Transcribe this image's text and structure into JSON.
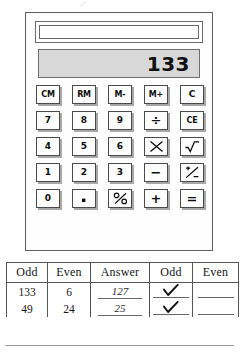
{
  "page": {
    "stray_mark": "⁄"
  },
  "calculator": {
    "display_value": "133",
    "solar_panel_label": "solar-panel",
    "keys": [
      [
        {
          "label": "CM",
          "name": "key-cm",
          "style": "wide-glyph"
        },
        {
          "label": "RM",
          "name": "key-rm",
          "style": "wide-glyph"
        },
        {
          "label": "M-",
          "name": "key-m-minus",
          "style": "wide-glyph"
        },
        {
          "label": "M+",
          "name": "key-m-plus",
          "style": "wide-glyph"
        },
        {
          "label": "C",
          "name": "key-c",
          "style": ""
        }
      ],
      [
        {
          "label": "7",
          "name": "key-7",
          "style": ""
        },
        {
          "label": "8",
          "name": "key-8",
          "style": ""
        },
        {
          "label": "9",
          "name": "key-9",
          "style": ""
        },
        {
          "label": "÷",
          "name": "key-divide",
          "style": "big-glyph"
        },
        {
          "label": "CE",
          "name": "key-ce",
          "style": "wide-glyph"
        }
      ],
      [
        {
          "label": "4",
          "name": "key-4",
          "style": ""
        },
        {
          "label": "5",
          "name": "key-5",
          "style": ""
        },
        {
          "label": "6",
          "name": "key-6",
          "style": ""
        },
        {
          "label": "×",
          "name": "key-multiply",
          "style": "big-glyph"
        },
        {
          "label": "√",
          "name": "key-square-root",
          "style": "big-glyph"
        }
      ],
      [
        {
          "label": "1",
          "name": "key-1",
          "style": ""
        },
        {
          "label": "2",
          "name": "key-2",
          "style": ""
        },
        {
          "label": "3",
          "name": "key-3",
          "style": ""
        },
        {
          "label": "−",
          "name": "key-minus",
          "style": "big-glyph"
        },
        {
          "label": "±",
          "name": "key-plus-minus",
          "style": "big-glyph"
        }
      ],
      [
        {
          "label": "0",
          "name": "key-0",
          "style": ""
        },
        {
          "label": "·",
          "name": "key-decimal-point",
          "style": "big-glyph"
        },
        {
          "label": "%",
          "name": "key-percent",
          "style": "big-glyph"
        },
        {
          "label": "+",
          "name": "key-plus",
          "style": "big-glyph"
        },
        {
          "label": "=",
          "name": "key-equals",
          "style": "big-glyph"
        }
      ]
    ]
  },
  "worksheet": {
    "headers": [
      "Odd",
      "Even",
      "Answer",
      "Odd",
      "Even"
    ],
    "rows": [
      {
        "odd": "133",
        "even": "6",
        "answer": "127",
        "odd_check": true,
        "even_check": false
      },
      {
        "odd": "49",
        "even": "24",
        "answer": "25",
        "odd_check": true,
        "even_check": false
      }
    ]
  }
}
